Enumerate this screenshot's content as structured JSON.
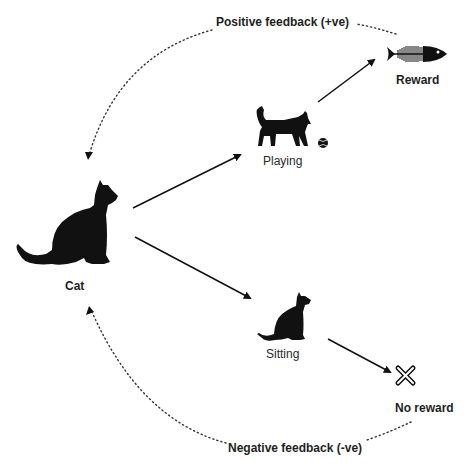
{
  "diagram": {
    "type": "reinforcement-learning-cycle",
    "nodes": [
      {
        "id": "cat",
        "label": "Cat",
        "icon": "sitting-cat-silhouette-icon"
      },
      {
        "id": "playing",
        "label": "Playing",
        "icon": "walking-cat-with-ball-icon"
      },
      {
        "id": "sitting",
        "label": "Sitting",
        "icon": "sitting-cat-icon"
      },
      {
        "id": "reward",
        "label": "Reward",
        "icon": "fish-bone-icon"
      },
      {
        "id": "no_reward",
        "label": "No reward",
        "icon": "x-mark-icon"
      }
    ],
    "edges": [
      {
        "from": "cat",
        "to": "playing",
        "style": "solid"
      },
      {
        "from": "cat",
        "to": "sitting",
        "style": "solid"
      },
      {
        "from": "playing",
        "to": "reward",
        "style": "solid"
      },
      {
        "from": "sitting",
        "to": "no_reward",
        "style": "solid"
      },
      {
        "from": "reward",
        "to": "cat",
        "style": "dotted",
        "label": "Positive feedback (+ve)"
      },
      {
        "from": "no_reward",
        "to": "cat",
        "style": "dotted",
        "label": "Negative feedback (-ve)"
      }
    ]
  },
  "labels": {
    "positive_feedback": "Positive feedback (+ve)",
    "negative_feedback": "Negative feedback (-ve)",
    "cat": "Cat",
    "playing": "Playing",
    "sitting": "Sitting",
    "reward": "Reward",
    "no_reward": "No reward"
  },
  "colors": {
    "ink": "#111111",
    "background": "#ffffff",
    "dotted_line": "#333333"
  }
}
